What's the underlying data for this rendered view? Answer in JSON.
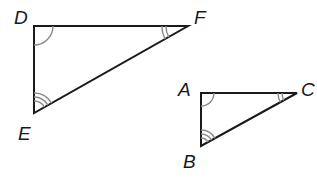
{
  "diagram": {
    "type": "similar-triangles",
    "colors": {
      "sides": "#1a1a1a",
      "angle_marks": "#8a8a8a",
      "background": "#ffffff"
    },
    "triangles": [
      {
        "name": "DEF",
        "vertices": {
          "D": {
            "label": "D",
            "angle_marks": 1
          },
          "F": {
            "label": "F",
            "angle_marks": 2
          },
          "E": {
            "label": "E",
            "angle_marks": 3
          }
        }
      },
      {
        "name": "ABC",
        "vertices": {
          "A": {
            "label": "A",
            "angle_marks": 1
          },
          "C": {
            "label": "C",
            "angle_marks": 2
          },
          "B": {
            "label": "B",
            "angle_marks": 3
          }
        }
      }
    ],
    "correspondence": [
      "D ↔ A",
      "F ↔ C",
      "E ↔ B"
    ]
  }
}
